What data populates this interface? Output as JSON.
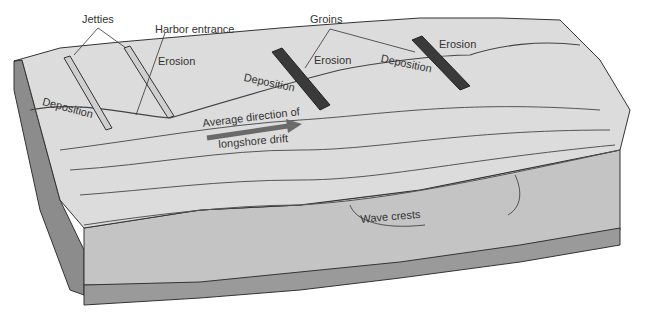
{
  "diagram": {
    "type": "block diagram",
    "labels": {
      "jetties": "Jetties",
      "harbor_entrance": "Harbor entrance",
      "groins": "Groins",
      "erosion_1": "Erosion",
      "erosion_2": "Erosion",
      "erosion_3": "Erosion",
      "deposition_1": "Deposition",
      "deposition_2": "Deposition",
      "deposition_3": "Deposition",
      "drift_line1": "Average direction of",
      "drift_line2": "longshore drift",
      "wave_crests": "Wave crests"
    },
    "colors": {
      "land_top": "#d9d9d9",
      "land_side": "#8c8c8c",
      "water_side": "#bdbdbd",
      "seafloor": "#9a9a9a",
      "arrow": "#6a6a6a",
      "groin": "#3a3a3a",
      "jetty": "#c8c8c8",
      "outline": "#333333"
    }
  }
}
